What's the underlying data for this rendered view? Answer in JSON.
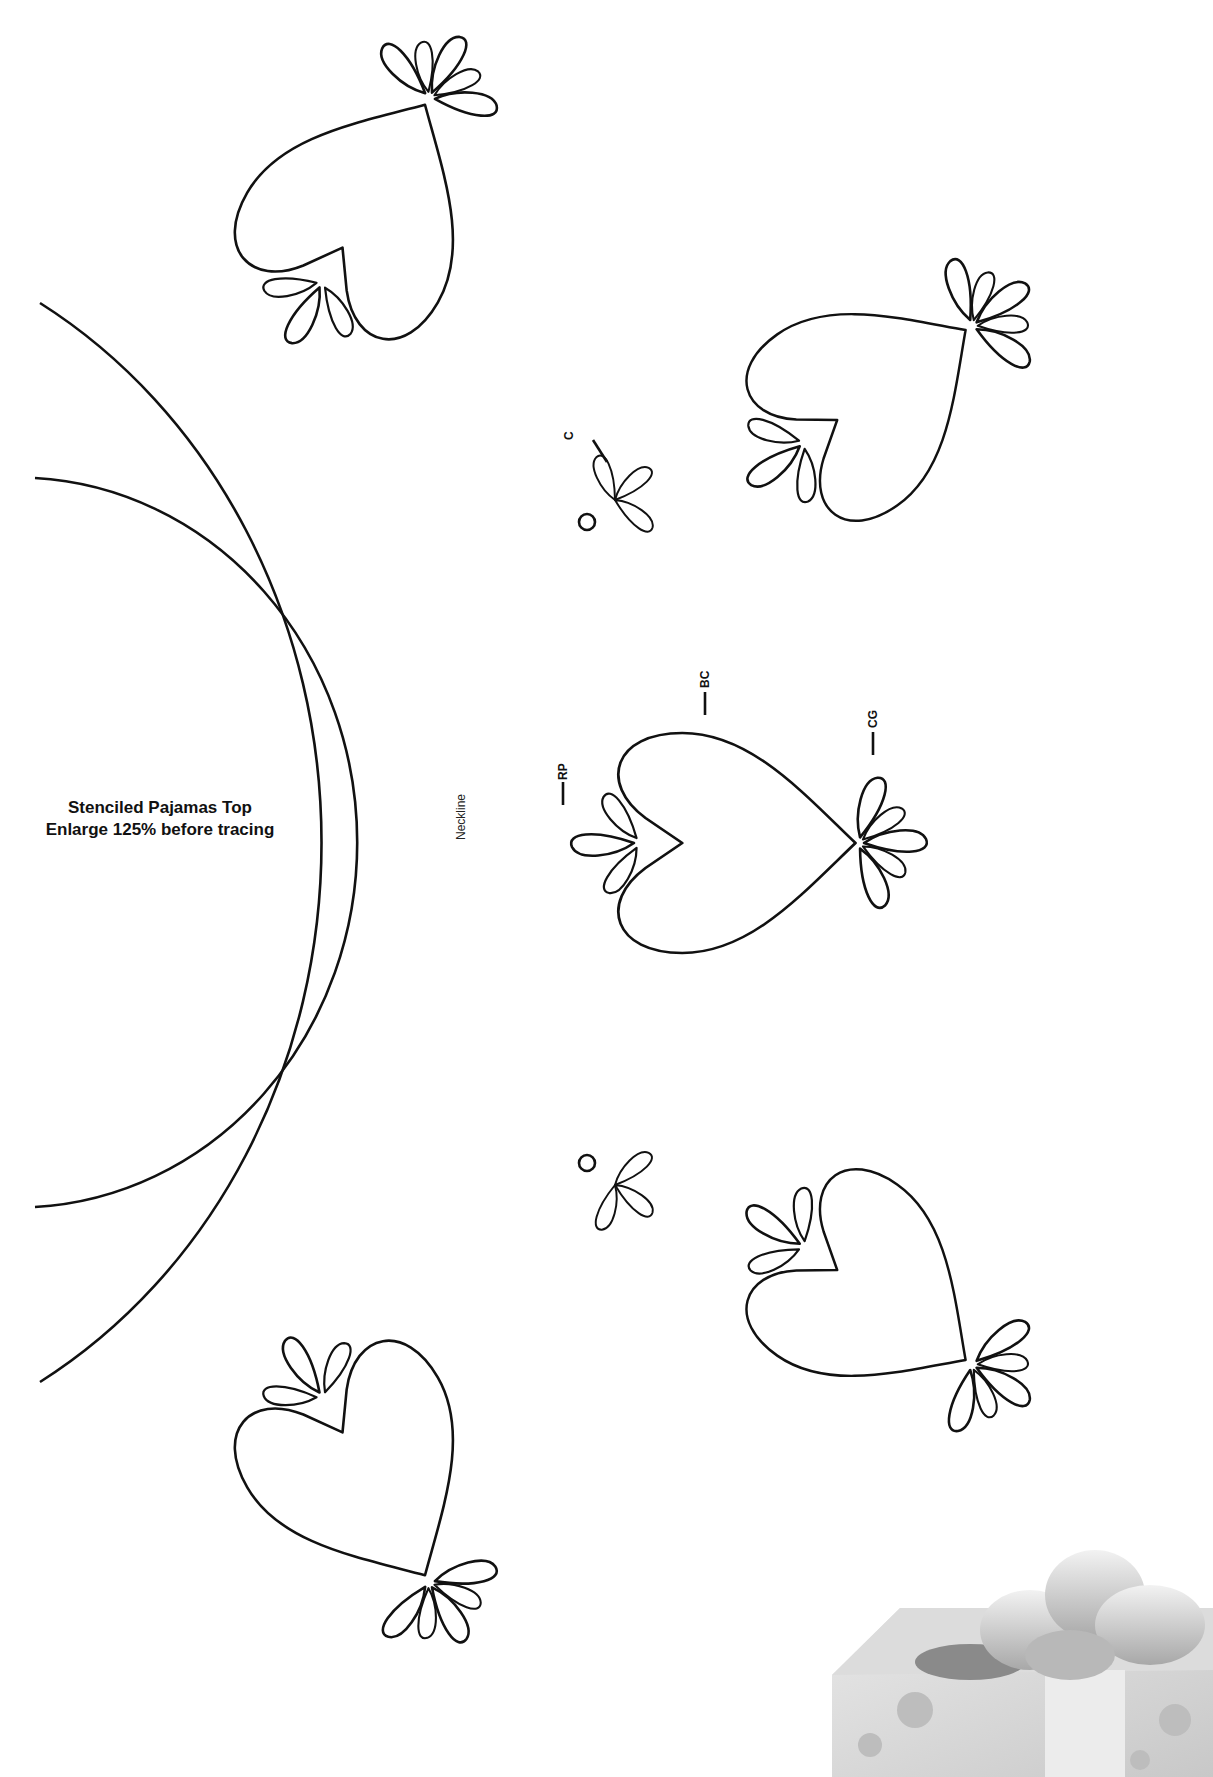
{
  "title": {
    "line1": "Stenciled Pajamas Top",
    "line2": "Enlarge 125% before tracing"
  },
  "labels": {
    "neckline": "Neckline",
    "rp": "RP",
    "bc": "BC",
    "cg": "CG",
    "c": "C"
  },
  "colors": {
    "line": "#111111",
    "background": "#ffffff"
  }
}
